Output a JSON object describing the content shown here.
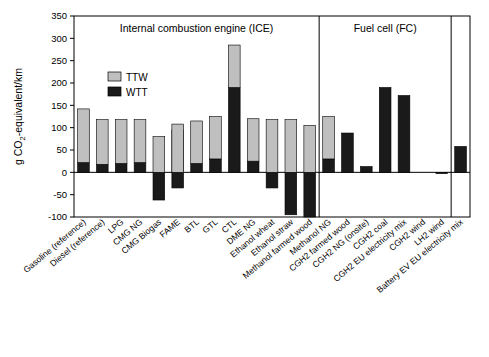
{
  "chart_data": {
    "type": "bar",
    "subtype": "stacked-bar",
    "title": "",
    "xlabel": "",
    "ylabel": "g CO2-equivalent/km",
    "ylim": [
      -100,
      350
    ],
    "yticks": [
      -100,
      -50,
      0,
      50,
      100,
      150,
      200,
      250,
      300,
      350
    ],
    "grid": false,
    "legend_position": "upper-left-inside",
    "legend": [
      "TTW",
      "WTT"
    ],
    "colors": {
      "TTW": "#bfbfbf",
      "WTT": "#1a1a1a",
      "axis": "#000000",
      "background": "#ffffff"
    },
    "group_labels": [
      "Internal combustion engine (ICE)",
      "Fuel cell (FC)"
    ],
    "group_spans": [
      [
        0,
        12
      ],
      [
        13,
        19
      ]
    ],
    "categories": [
      "Gasoline (reference)",
      "Diesel (reference)",
      "LPG",
      "CMG NG",
      "CMG Biogas",
      "FAME",
      "BTL",
      "GTL",
      "CTL",
      "DME NG",
      "Ethanol wheat",
      "Ethanol straw",
      "Methanol farmed wood",
      "Methanol NG",
      "CGH2 farmed wood",
      "CGH2 NG (onsite)",
      "CGH2 coal",
      "CGH2 EU electricity mix",
      "CGH2 wind",
      "LH2 wind",
      "Battery EV EU electricity mix"
    ],
    "series": [
      {
        "name": "TTW",
        "values": [
          120,
          100,
          98,
          96,
          0,
          95,
          95,
          95,
          95,
          95,
          0,
          0,
          0,
          95,
          0,
          0,
          0,
          0,
          0,
          0,
          0
        ]
      },
      {
        "name": "WTT",
        "values": [
          22,
          18,
          20,
          22,
          -62,
          -35,
          20,
          30,
          190,
          25,
          -35,
          -95,
          -100,
          30,
          88,
          13,
          190,
          172,
          0,
          -3,
          58
        ]
      },
      {
        "name": "total",
        "values": [
          142,
          118,
          118,
          118,
          80,
          108,
          115,
          125,
          285,
          120,
          118,
          118,
          105,
          125,
          88,
          13,
          190,
          172,
          0,
          -3,
          58
        ]
      }
    ]
  },
  "axis": {
    "y_title": "g CO2-equivalent/km",
    "y_title_parts": {
      "pre": "g CO",
      "sub": "2",
      "post": "-equivalent/km"
    }
  },
  "legend": {
    "items": [
      {
        "label": "TTW",
        "color": "#bfbfbf"
      },
      {
        "label": "WTT",
        "color": "#1a1a1a"
      }
    ]
  },
  "groups": {
    "ice": "Internal combustion engine (ICE)",
    "fc": "Fuel cell (FC)"
  },
  "yticks": [
    "350",
    "300",
    "250",
    "200",
    "150",
    "100",
    "50",
    "0",
    "-50",
    "-100"
  ],
  "categories": [
    "Gasoline (reference)",
    "Diesel (reference)",
    "LPG",
    "CMG NG",
    "CMG Biogas",
    "FAME",
    "BTL",
    "GTL",
    "CTL",
    "DME NG",
    "Ethanol wheat",
    "Ethanol straw",
    "Methanol farmed wood",
    "Methanol NG",
    "CGH2 farmed wood",
    "CGH2 NG (onsite)",
    "CGH2 coal",
    "CGH2 EU electricity mix",
    "CGH2 wind",
    "LH2 wind",
    "Battery EV EU electricity mix"
  ]
}
